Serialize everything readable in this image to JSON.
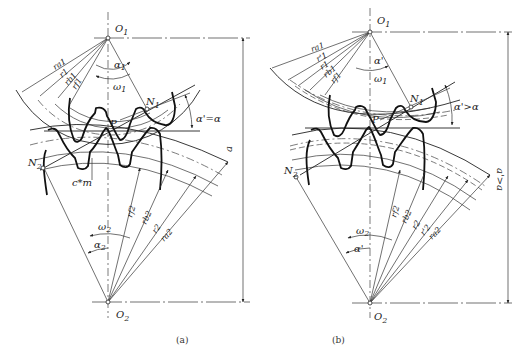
{
  "figure_a": {
    "caption": "(a)",
    "center_top": "O",
    "center_top_sub": "1",
    "center_bottom": "O",
    "center_bottom_sub": "2",
    "pitch_point": "P",
    "n1": "N",
    "n1_sub": "1",
    "n2": "N",
    "n2_sub": "2",
    "angle_label": "α'=α",
    "center_distance": "a",
    "clearance": "c*m",
    "alpha1": "α",
    "alpha1_sub": "1",
    "omega1": "ω",
    "omega1_sub": "1",
    "omega2": "ω",
    "omega2_sub": "2",
    "alpha2": "α",
    "alpha2_sub": "2",
    "radii_top": [
      "ra1",
      "r1",
      "rb1",
      "rf1"
    ],
    "radii_bottom": [
      "rf2",
      "rb2",
      "r2",
      "ra2"
    ]
  },
  "figure_b": {
    "caption": "(b)",
    "center_top": "O",
    "center_top_sub": "1",
    "center_bottom": "O",
    "center_bottom_sub": "2",
    "pitch_point": "P",
    "n1": "N",
    "n1_sub": "1",
    "n2": "N",
    "n2_sub": "2",
    "angle_label": "α'>α",
    "center_distance": "a'>a",
    "alpha_prime_top": "α'",
    "omega1": "ω",
    "omega1_sub": "1",
    "omega2": "ω",
    "omega2_sub": "2",
    "alpha_prime_bottom": "α'",
    "radii_top": [
      "ra1",
      "r'1",
      "r1",
      "rb1",
      "rf1"
    ],
    "radii_bottom": [
      "rf2",
      "rb2",
      "r2",
      "r'2",
      "ra2"
    ]
  }
}
